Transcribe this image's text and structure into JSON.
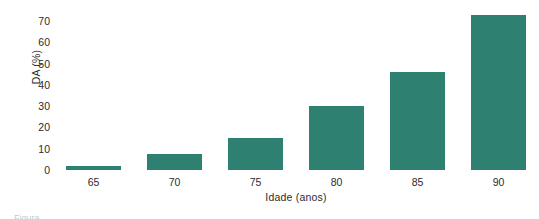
{
  "chart_data": {
    "type": "bar",
    "title": "",
    "subtitle": "",
    "xlabel": "Idade (anos)",
    "ylabel": "DA (%)",
    "categories": [
      "65",
      "70",
      "75",
      "80",
      "85",
      "90"
    ],
    "values": [
      2,
      7.5,
      15,
      30,
      46,
      73
    ],
    "ylim": [
      0,
      75
    ],
    "ytick_labels": [
      "0",
      "10",
      "20",
      "30",
      "40",
      "50",
      "60",
      "70"
    ],
    "ytick_values": [
      0,
      10,
      20,
      30,
      40,
      50,
      60,
      70
    ],
    "xtick_labels": [
      "65",
      "70",
      "75",
      "80",
      "85",
      "90"
    ],
    "grid": false,
    "legend": null,
    "legend_position": "none",
    "series": [
      {
        "name": "DA (%)",
        "values": [
          2,
          7.5,
          15,
          30,
          46,
          73
        ]
      }
    ],
    "annotations": [],
    "bar_color": "#2e8071",
    "text_color": "#2b2b2b",
    "background_color": "#ffffff"
  },
  "caption": {
    "partial_text": "Figura"
  }
}
